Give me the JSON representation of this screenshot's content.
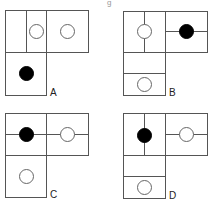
{
  "title_fragment": "g",
  "options": [
    {
      "label": "A",
      "label_pos": [
        50,
        96
      ],
      "boxes": [
        [
          5,
          10,
          83,
          42
        ],
        [
          5,
          52,
          41,
          43
        ]
      ],
      "lines": [
        [
          26,
          10,
          26,
          52
        ],
        [
          46,
          10,
          46,
          52
        ]
      ],
      "circles": [
        {
          "cx": 36,
          "cy": 31,
          "r": 7,
          "fill": "open"
        },
        {
          "cx": 67,
          "cy": 31,
          "r": 7,
          "fill": "open"
        },
        {
          "cx": 26,
          "cy": 73,
          "r": 7,
          "fill": "solid"
        }
      ]
    },
    {
      "label": "B",
      "label_pos": [
        169,
        96
      ],
      "boxes": [
        [
          123,
          11,
          84,
          41
        ],
        [
          123,
          52,
          42,
          43
        ]
      ],
      "lines": [
        [
          165,
          11,
          165,
          52
        ],
        [
          144,
          11,
          144,
          52
        ],
        [
          165,
          31,
          207,
          31
        ],
        [
          123,
          73,
          165,
          73
        ]
      ],
      "circles": [
        {
          "cx": 144,
          "cy": 31,
          "r": 7,
          "fill": "open"
        },
        {
          "cx": 186,
          "cy": 31,
          "r": 7,
          "fill": "solid"
        },
        {
          "cx": 144,
          "cy": 84,
          "r": 7,
          "fill": "open"
        }
      ]
    },
    {
      "label": "C",
      "label_pos": [
        50,
        198
      ],
      "boxes": [
        [
          5,
          113,
          83,
          42
        ],
        [
          5,
          155,
          41,
          42
        ]
      ],
      "lines": [
        [
          46,
          113,
          46,
          155
        ],
        [
          5,
          134,
          88,
          134
        ]
      ],
      "circles": [
        {
          "cx": 26,
          "cy": 134,
          "r": 7,
          "fill": "solid"
        },
        {
          "cx": 67,
          "cy": 134,
          "r": 7,
          "fill": "open"
        },
        {
          "cx": 26,
          "cy": 176,
          "r": 7,
          "fill": "open"
        }
      ]
    },
    {
      "label": "D",
      "label_pos": [
        169,
        199
      ],
      "boxes": [
        [
          123,
          113,
          84,
          42
        ],
        [
          123,
          155,
          42,
          43
        ]
      ],
      "lines": [
        [
          165,
          113,
          165,
          155
        ],
        [
          144,
          113,
          144,
          155
        ],
        [
          165,
          134,
          207,
          134
        ],
        [
          123,
          176,
          165,
          176
        ]
      ],
      "circles": [
        {
          "cx": 144,
          "cy": 135,
          "r": 7,
          "fill": "solid"
        },
        {
          "cx": 186,
          "cy": 134,
          "r": 7,
          "fill": "open"
        },
        {
          "cx": 144,
          "cy": 187,
          "r": 7,
          "fill": "open"
        }
      ]
    }
  ]
}
